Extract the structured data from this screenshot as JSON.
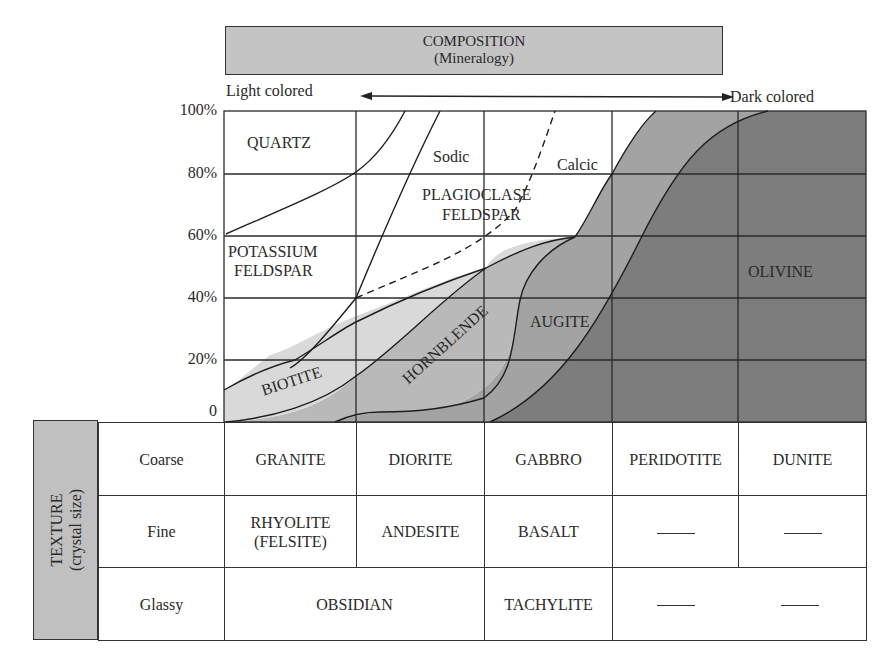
{
  "composition_header": {
    "title": "COMPOSITION",
    "subtitle": "(Mineralogy)"
  },
  "color_scale": {
    "left_label": "Light colored",
    "right_label": "Dark colored",
    "arrow": "double-headed-arrow"
  },
  "y_axis": {
    "ticks": [
      "100%",
      "80%",
      "60%",
      "40%",
      "20%",
      "0"
    ]
  },
  "minerals": {
    "quartz": "QUARTZ",
    "potassium_feldspar_1": "POTASSIUM",
    "potassium_feldspar_2": "FELDSPAR",
    "sodic": "Sodic",
    "calcic": "Calcic",
    "plagioclase_1": "PLAGIOCLASE",
    "plagioclase_2": "FELDSPAR",
    "biotite": "BIOTITE",
    "hornblende": "HORNBLENDE",
    "augite": "AUGITE",
    "olivine": "OLIVINE"
  },
  "fill_colors": {
    "biotite": "#d9d9d9",
    "hornblende": "#b9b9b9",
    "augite": "#a3a3a3",
    "olivine": "#7d7d7d",
    "header": "#c4c4c4"
  },
  "texture_header": {
    "title": "TEXTURE",
    "subtitle": "(crystal size)"
  },
  "texture_table": {
    "rows": [
      {
        "texture": "Coarse",
        "cells": [
          "GRANITE",
          "DIORITE",
          "GABBRO",
          "PERIDOTITE",
          "DUNITE"
        ]
      },
      {
        "texture": "Fine",
        "cells": [
          "RHYOLITE",
          "(FELSITE)",
          "ANDESITE",
          "BASALT",
          "—",
          "—"
        ]
      },
      {
        "texture": "Glassy",
        "cells": [
          "OBSIDIAN",
          "TACHYLITE",
          "—",
          "—"
        ]
      }
    ]
  }
}
